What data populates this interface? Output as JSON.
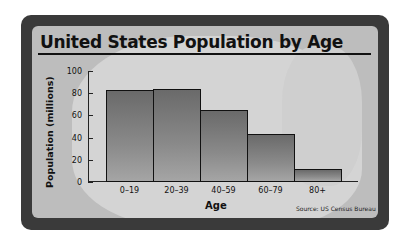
{
  "chart_data": {
    "type": "bar",
    "title": "United States Population by Age",
    "xlabel": "Age",
    "ylabel": "Population (millions)",
    "categories": [
      "0–19",
      "20–39",
      "40–59",
      "60–79",
      "80+"
    ],
    "values": [
      83,
      84,
      65,
      43,
      12
    ],
    "ylim": [
      0,
      100
    ],
    "yticks": [
      0,
      20,
      40,
      60,
      80,
      100
    ],
    "grid": false,
    "legend": null,
    "source": "Source: US Census Bureau"
  },
  "colors": {
    "frame": "#3a3a3a",
    "panel": "#bdbdbd",
    "bar_top": "#6a6a6a",
    "bar_bottom": "#a5a5a5"
  }
}
